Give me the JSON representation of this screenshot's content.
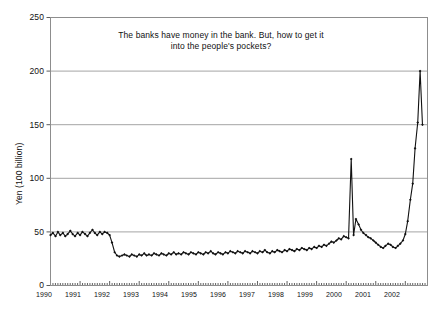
{
  "chart_data": {
    "type": "line",
    "title": "The banks have money in the bank. But, how to get it into the people's pockets?",
    "title_line1": "The banks have money in the bank. But, how to get it",
    "title_line2": "into the people's pockets?",
    "xlabel": "",
    "ylabel": "Yen (100 billion)",
    "ylim": [
      0,
      250
    ],
    "xlim": [
      1990,
      2002.75
    ],
    "yticks": [
      0,
      50,
      100,
      150,
      200,
      250
    ],
    "ytick_labels": [
      "0",
      "50",
      "100",
      "150",
      "200",
      "250"
    ],
    "xtick_labels": [
      "1990",
      "1991",
      "1992",
      "1993",
      "1994",
      "1995",
      "1996",
      "1997",
      "1998",
      "1999",
      "2000",
      "2001",
      "2002"
    ],
    "xticks": [
      1990,
      1991,
      1992,
      1993,
      1994,
      1995,
      1996,
      1997,
      1998,
      1999,
      2000,
      2001,
      2002
    ],
    "grid": true,
    "grid_color": "#9a9a9a",
    "line_color": "#111111",
    "marker": "diamond",
    "legend": "none",
    "x_minor_tick_interval_months": 1,
    "series": [
      {
        "name": "Yen (100 billion)",
        "x": [
          1990.0,
          1990.08,
          1990.17,
          1990.25,
          1990.33,
          1990.42,
          1990.5,
          1990.58,
          1990.67,
          1990.75,
          1990.83,
          1990.92,
          1991.0,
          1991.08,
          1991.17,
          1991.25,
          1991.33,
          1991.42,
          1991.5,
          1991.58,
          1991.67,
          1991.75,
          1991.83,
          1991.92,
          1992.0,
          1992.08,
          1992.17,
          1992.25,
          1992.33,
          1992.42,
          1992.5,
          1992.58,
          1992.67,
          1992.75,
          1992.83,
          1992.92,
          1993.0,
          1993.08,
          1993.17,
          1993.25,
          1993.33,
          1993.42,
          1993.5,
          1993.58,
          1993.67,
          1993.75,
          1993.83,
          1993.92,
          1994.0,
          1994.08,
          1994.17,
          1994.25,
          1994.33,
          1994.42,
          1994.5,
          1994.58,
          1994.67,
          1994.75,
          1994.83,
          1994.92,
          1995.0,
          1995.08,
          1995.17,
          1995.25,
          1995.33,
          1995.42,
          1995.5,
          1995.58,
          1995.67,
          1995.75,
          1995.83,
          1995.92,
          1996.0,
          1996.08,
          1996.17,
          1996.25,
          1996.33,
          1996.42,
          1996.5,
          1996.58,
          1996.67,
          1996.75,
          1996.83,
          1996.92,
          1997.0,
          1997.08,
          1997.17,
          1997.25,
          1997.33,
          1997.42,
          1997.5,
          1997.58,
          1997.67,
          1997.75,
          1997.83,
          1997.92,
          1998.0,
          1998.08,
          1998.17,
          1998.25,
          1998.33,
          1998.42,
          1998.5,
          1998.58,
          1998.67,
          1998.75,
          1998.83,
          1998.92,
          1999.0,
          1999.08,
          1999.17,
          1999.25,
          1999.33,
          1999.42,
          1999.5,
          1999.58,
          1999.67,
          1999.75,
          1999.83,
          1999.92,
          2000.0,
          2000.08,
          2000.17,
          2000.25,
          2000.33,
          2000.42,
          2000.5,
          2000.58,
          2000.67,
          2000.75,
          2000.83,
          2000.92,
          2001.0,
          2001.08,
          2001.17,
          2001.25,
          2001.33,
          2001.42,
          2001.5,
          2001.58,
          2001.67,
          2001.75,
          2001.83,
          2001.92,
          2002.0,
          2002.08,
          2002.17,
          2002.25,
          2002.33,
          2002.42,
          2002.5,
          2002.58
        ],
        "values": [
          47,
          49,
          46,
          50,
          47,
          49,
          46,
          48,
          51,
          48,
          46,
          49,
          47,
          50,
          48,
          46,
          49,
          52,
          49,
          47,
          50,
          48,
          50,
          49,
          47,
          40,
          31,
          28,
          27,
          28,
          29,
          28,
          27,
          29,
          28,
          27,
          29,
          28,
          30,
          28,
          29,
          28,
          30,
          29,
          28,
          30,
          29,
          28,
          30,
          29,
          31,
          29,
          30,
          29,
          31,
          30,
          29,
          31,
          30,
          29,
          31,
          30,
          29,
          31,
          30,
          32,
          30,
          29,
          31,
          30,
          29,
          31,
          30,
          32,
          31,
          30,
          32,
          31,
          30,
          32,
          31,
          30,
          32,
          31,
          30,
          32,
          31,
          33,
          31,
          30,
          32,
          31,
          33,
          32,
          31,
          33,
          32,
          34,
          33,
          32,
          34,
          33,
          35,
          34,
          33,
          35,
          34,
          36,
          35,
          37,
          36,
          38,
          37,
          39,
          41,
          40,
          42,
          44,
          43,
          46,
          45,
          44,
          118,
          47,
          62,
          57,
          52,
          49,
          47,
          45,
          44,
          42,
          40,
          38,
          36,
          35,
          37,
          39,
          38,
          36,
          35,
          37,
          39,
          42,
          48,
          60,
          80,
          95,
          128,
          152,
          200,
          150
        ]
      }
    ]
  }
}
